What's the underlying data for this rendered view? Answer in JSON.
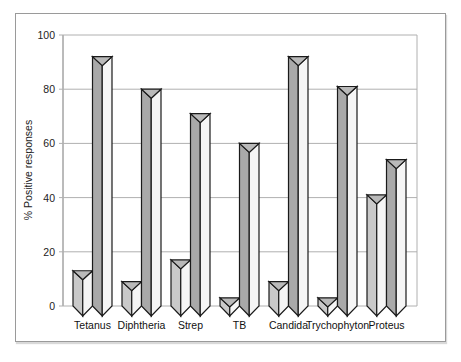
{
  "chart_data": {
    "type": "bar",
    "title": "",
    "xlabel": "",
    "ylabel": "% Positive responses",
    "ylim": [
      0,
      100
    ],
    "yticks": [
      0,
      20,
      40,
      60,
      80,
      100
    ],
    "grid": true,
    "legend": null,
    "categories": [
      "Tetanus",
      "Diphtheria",
      "Strep",
      "TB",
      "Candida",
      "Trychophyton",
      "Proteus"
    ],
    "series": [
      {
        "name": "Series 1 (left, light)",
        "values": [
          13,
          9,
          17,
          3,
          9,
          3,
          41
        ]
      },
      {
        "name": "Series 2 (right, dark)",
        "values": [
          92,
          80,
          71,
          60,
          92,
          81,
          54
        ]
      }
    ]
  },
  "colors": {
    "series1_face": "#c9c9c9",
    "series2_face": "#a9a9a9",
    "side_face": "#f5f5f5",
    "top_face": "#b9b9b9",
    "outline": "#1a1a1a",
    "grid": "#b0b0b0"
  }
}
